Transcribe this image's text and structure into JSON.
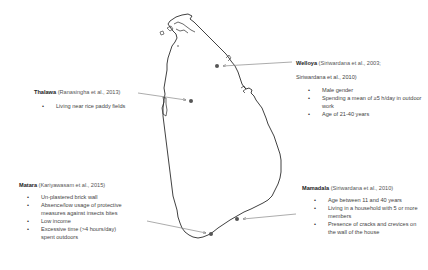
{
  "map": {
    "region": "Sri Lanka",
    "outline_color": "#2b2b2b",
    "marker_color": "#555555",
    "arrow_color": "#888888"
  },
  "sites": {
    "welloya": {
      "name": "Welloya",
      "reference_line1": "(Siriwardana et al., 2003;",
      "reference_line2": "Siriwardana et al., 2010)",
      "factors": [
        "Male gender",
        "Spending a mean of ≥5 h/day in outdoor work",
        "Age of 21-40 years"
      ]
    },
    "thalawa": {
      "name": "Thalawa",
      "reference": "(Ranasingha et al., 2013)",
      "factors": [
        "Living near rice paddy fields"
      ]
    },
    "matara": {
      "name": "Matara",
      "reference": "(Kariyawasam et al., 2015)",
      "factors": [
        "Un-plastered brick wall",
        "Absence/low usage of protective measures against insects bites",
        "Low income",
        "Excessive time (>4 hours/day) spent outdoors"
      ]
    },
    "mamadala": {
      "name": "Mamadala",
      "reference": "(Siriwardana et al., 2010)",
      "factors": [
        "Age between 11 and 40 years",
        "Living in a household with 5 or more members",
        "Presence of cracks and crevices on the wall of the house"
      ]
    }
  }
}
